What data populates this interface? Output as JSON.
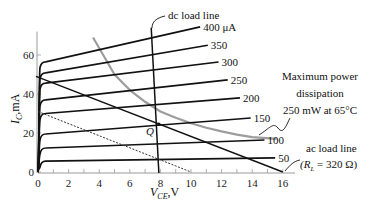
{
  "chart_data": {
    "type": "line",
    "title": "",
    "xlabel": "V_CE,V",
    "ylabel": "I_C,mA",
    "xlim": [
      0,
      16
    ],
    "ylim": [
      0,
      70
    ],
    "x_ticks": [
      0,
      2,
      4,
      6,
      8,
      10,
      12,
      14,
      16
    ],
    "y_ticks": [
      0,
      20,
      40,
      60
    ],
    "grid": false,
    "legend": "none",
    "series": [
      {
        "name": "400 μA",
        "label": "400 μA",
        "points": [
          [
            0,
            0
          ],
          [
            0.15,
            45
          ],
          [
            0.5,
            56.5
          ],
          [
            10.6,
            74.4
          ]
        ]
      },
      {
        "name": "350 μA",
        "label": "350",
        "points": [
          [
            0,
            0
          ],
          [
            0.15,
            40
          ],
          [
            0.5,
            50.8
          ],
          [
            11.1,
            65
          ]
        ]
      },
      {
        "name": "300 μA",
        "label": "300",
        "points": [
          [
            0,
            0
          ],
          [
            0.15,
            36
          ],
          [
            0.5,
            45.6
          ],
          [
            11.8,
            56.4
          ]
        ]
      },
      {
        "name": "250 μA",
        "label": "250",
        "points": [
          [
            0,
            0
          ],
          [
            0.15,
            29
          ],
          [
            0.5,
            37
          ],
          [
            12.4,
            47.2
          ]
        ]
      },
      {
        "name": "200 μA",
        "label": "200",
        "points": [
          [
            0,
            0
          ],
          [
            0.15,
            23
          ],
          [
            0.5,
            30
          ],
          [
            13.2,
            38
          ]
        ]
      },
      {
        "name": "150 μA",
        "label": "150",
        "points": [
          [
            0,
            0
          ],
          [
            0.15,
            15
          ],
          [
            0.5,
            19.5
          ],
          [
            13.9,
            27.7
          ]
        ]
      },
      {
        "name": "100 μA",
        "label": "100",
        "points": [
          [
            0,
            0
          ],
          [
            0.15,
            9
          ],
          [
            0.5,
            12.3
          ],
          [
            14.8,
            16.4
          ]
        ]
      },
      {
        "name": "50 μA",
        "label": "50",
        "points": [
          [
            0,
            0
          ],
          [
            0.15,
            4
          ],
          [
            0.5,
            5.6
          ],
          [
            15.5,
            7.2
          ]
        ]
      }
    ],
    "load_lines": {
      "dc": {
        "label": "dc load line",
        "points": [
          [
            7.4,
            74
          ],
          [
            7.9,
            0
          ]
        ]
      },
      "ac": {
        "label": "ac load line",
        "sublabel": "(R_L = 320 Ω)",
        "points": [
          [
            0,
            48.5
          ],
          [
            16,
            0
          ]
        ]
      },
      "dashed": {
        "points": [
          [
            0,
            31
          ],
          [
            10,
            0
          ]
        ]
      }
    },
    "q_point": {
      "label": "Q",
      "vce": 7.9,
      "ic": 24.6
    },
    "max_power_curve": {
      "label_lines": [
        "Maximum power",
        "dissipation",
        "250 mW at 65°C"
      ],
      "points": [
        [
          3.6,
          69
        ],
        [
          5,
          50
        ],
        [
          6,
          42
        ],
        [
          7,
          36
        ],
        [
          8,
          31
        ],
        [
          9,
          27.8
        ],
        [
          10,
          25
        ],
        [
          11,
          22.7
        ],
        [
          12,
          20.8
        ],
        [
          13,
          19.2
        ],
        [
          14,
          17.9
        ],
        [
          15.6,
          17
        ]
      ]
    },
    "annotations": [
      {
        "text": "dc load line"
      },
      {
        "text": "Maximum power dissipation 250 mW at 65°C"
      },
      {
        "text": "ac load line (R_L = 320 Ω)"
      },
      {
        "text": "Q"
      }
    ]
  },
  "labels": {
    "x_axis": {
      "main": "V",
      "sub": "CE",
      "unit": ",V"
    },
    "y_axis": {
      "main": "I",
      "sub": "C",
      "unit": ",mA"
    },
    "dc_load_line": "dc load line",
    "ac_load_line": "ac load line",
    "ac_rl_open": "(R",
    "ac_rl_sub": "L",
    "ac_rl_rest": " = 320 Ω)",
    "power_line1": "Maximum power",
    "power_line2": "dissipation",
    "power_line3": "250 mW at 65°C",
    "q_label": "Q"
  }
}
